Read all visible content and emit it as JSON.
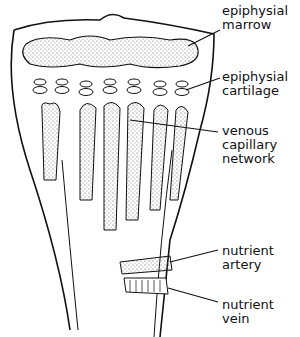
{
  "diagram": {
    "labels": [
      {
        "id": "epiphysial-marrow",
        "line1": "epiphysial",
        "line2": "marrow",
        "x": 222,
        "y": 4
      },
      {
        "id": "epiphysial-cartilage",
        "line1": "epiphysial",
        "line2": "cartilage",
        "x": 222,
        "y": 70
      },
      {
        "id": "venous-capillary-network",
        "line1": "venous",
        "line2": "capillary",
        "line3": "network",
        "x": 222,
        "y": 124
      },
      {
        "id": "nutrient-artery",
        "line1": "nutrient",
        "line2": "artery",
        "x": 222,
        "y": 244
      },
      {
        "id": "nutrient-vein",
        "line1": "nutrient",
        "line2": "vein",
        "x": 222,
        "y": 298
      }
    ],
    "colors": {
      "ink": "#111111",
      "background": "#ffffff",
      "stipple": "#555555"
    }
  }
}
